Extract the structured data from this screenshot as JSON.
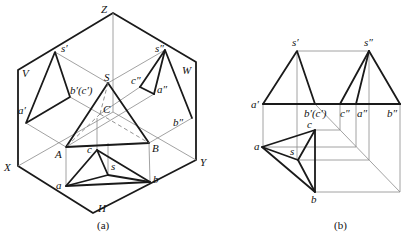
{
  "figure_a": {
    "caption": "(a)",
    "plane_labels": {
      "V": "V",
      "W": "W",
      "H": "H"
    },
    "axis_labels": {
      "X": "X",
      "Y": "Y",
      "Z": "Z"
    },
    "space_points": {
      "S": "S",
      "A": "A",
      "B": "B",
      "C": "C"
    },
    "front_view": {
      "s": "s′",
      "a": "a′",
      "bc": "b′(c′)"
    },
    "side_view": {
      "s": "s″",
      "c": "c″",
      "a": "a″",
      "b": "b″"
    },
    "top_view": {
      "s": "s",
      "a": "a",
      "b": "b",
      "c": "c"
    }
  },
  "figure_b": {
    "caption": "(b)",
    "front_view": {
      "s": "s′",
      "a": "a′",
      "bc": "b′(c′)"
    },
    "side_view": {
      "s": "s″",
      "c": "c″",
      "a": "a″",
      "b": "b″"
    },
    "top_view": {
      "s": "s",
      "a": "a",
      "b": "b",
      "c": "c"
    }
  }
}
